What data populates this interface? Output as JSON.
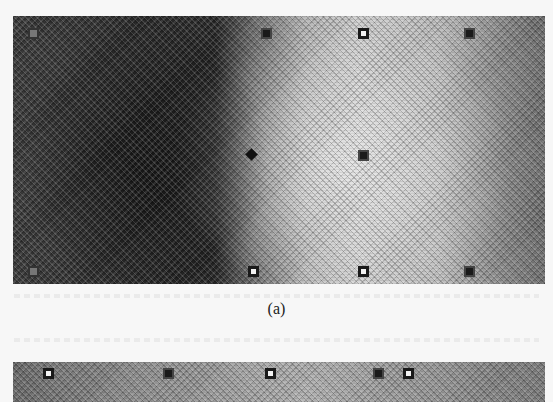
{
  "figure": {
    "panels": [
      {
        "id": "a",
        "caption": "(a)",
        "description": "Grayscale noisy intensity map: dark region on the left, bright speckled region on the right with square fiducial markers",
        "markers": [
          {
            "shape": "square-filled",
            "x": 248,
            "y": 12
          },
          {
            "shape": "square-open",
            "x": 345,
            "y": 12
          },
          {
            "shape": "square-filled",
            "x": 451,
            "y": 12
          },
          {
            "shape": "diamond",
            "x": 234,
            "y": 134
          },
          {
            "shape": "square-filled",
            "x": 345,
            "y": 134
          },
          {
            "shape": "square-open",
            "x": 235,
            "y": 250
          },
          {
            "shape": "square-open",
            "x": 345,
            "y": 250
          },
          {
            "shape": "square-filled",
            "x": 451,
            "y": 250
          },
          {
            "shape": "gray",
            "x": 15,
            "y": 12
          },
          {
            "shape": "gray",
            "x": 15,
            "y": 250
          }
        ]
      },
      {
        "id": "b",
        "caption": "",
        "description": "Second grayscale noisy intensity map (partially visible)",
        "markers": [
          {
            "shape": "square-open",
            "x": 30,
            "y": 6
          },
          {
            "shape": "square-filled",
            "x": 150,
            "y": 6
          },
          {
            "shape": "square-open",
            "x": 252,
            "y": 6
          },
          {
            "shape": "square-filled",
            "x": 360,
            "y": 6
          },
          {
            "shape": "square-open",
            "x": 390,
            "y": 6
          }
        ]
      }
    ]
  }
}
